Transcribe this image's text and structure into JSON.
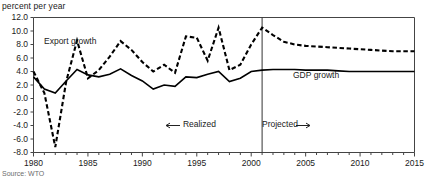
{
  "figure": {
    "y_axis_title": "percent per year",
    "source_note": "Source: WTO"
  },
  "annotations": {
    "export_label": "Export growth",
    "gdp_label": "GDP growth",
    "realized_label": "Realized",
    "realized_arrow": "←",
    "projected_label": "Projected",
    "projected_arrow": "→"
  },
  "chart_data": {
    "type": "line",
    "title": "",
    "subtitle": "",
    "xlabel": "",
    "ylabel": "percent per year",
    "xlim": [
      1980,
      2015
    ],
    "ylim": [
      -8.0,
      12.0
    ],
    "grid": false,
    "legend_position": "inline-annotations",
    "y_ticks": [
      -8.0,
      -6.0,
      -4.0,
      -2.0,
      0.0,
      2.0,
      4.0,
      6.0,
      8.0,
      10.0,
      12.0
    ],
    "y_tick_labels": [
      "-8.0",
      "-6.0",
      "-4.0",
      "-2.0",
      "0.0",
      "2.0",
      "4.0",
      "6.0",
      "8.0",
      "10.0",
      "12.0"
    ],
    "x_ticks": [
      1980,
      1985,
      1990,
      1995,
      2000,
      2005,
      2010,
      2015
    ],
    "x_tick_labels": [
      "1980",
      "1985",
      "1990",
      "1995",
      "2000",
      "2005",
      "2010",
      "2015"
    ],
    "x_minor_tick_step": 1,
    "projection_divider_x": 2001,
    "x": [
      1980,
      1981,
      1982,
      1983,
      1984,
      1985,
      1986,
      1987,
      1988,
      1989,
      1990,
      1991,
      1992,
      1993,
      1994,
      1995,
      1996,
      1997,
      1998,
      1999,
      2000,
      2001,
      2002,
      2003,
      2004,
      2005,
      2006,
      2007,
      2008,
      2009,
      2010,
      2011,
      2012,
      2013,
      2014,
      2015
    ],
    "series": [
      {
        "name": "Export growth",
        "style": "dashed",
        "color": "#000000",
        "values": [
          4.0,
          0.8,
          -7.2,
          2.5,
          8.6,
          3.0,
          4.2,
          6.2,
          8.5,
          7.2,
          5.4,
          4.0,
          5.0,
          3.8,
          9.2,
          9.0,
          5.6,
          10.5,
          4.2,
          5.0,
          8.0,
          10.5,
          9.4,
          8.4,
          8.0,
          7.8,
          7.7,
          7.6,
          7.5,
          7.4,
          7.3,
          7.2,
          7.1,
          7.0,
          7.0,
          7.0
        ]
      },
      {
        "name": "GDP growth",
        "style": "solid",
        "color": "#000000",
        "values": [
          3.2,
          1.4,
          0.8,
          2.6,
          4.3,
          3.5,
          3.2,
          3.6,
          4.4,
          3.4,
          2.6,
          1.4,
          2.0,
          1.8,
          3.2,
          3.1,
          3.6,
          4.0,
          2.5,
          3.0,
          4.0,
          4.2,
          4.3,
          4.3,
          4.3,
          4.2,
          4.2,
          4.2,
          4.1,
          4.0,
          4.0,
          4.0,
          4.0,
          4.0,
          4.0,
          4.0
        ]
      }
    ]
  }
}
